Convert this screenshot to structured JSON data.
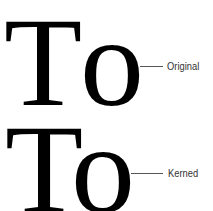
{
  "figure": {
    "rows": [
      {
        "id": "original",
        "glyphs": [
          "T",
          "o"
        ],
        "label": "Original"
      },
      {
        "id": "kerned",
        "glyphs": [
          "T",
          "o"
        ],
        "label": "Kerned"
      }
    ],
    "colors": {
      "glyph": "#000000",
      "leader_line": "#555555",
      "label": "#333333",
      "background": "#ffffff"
    }
  }
}
